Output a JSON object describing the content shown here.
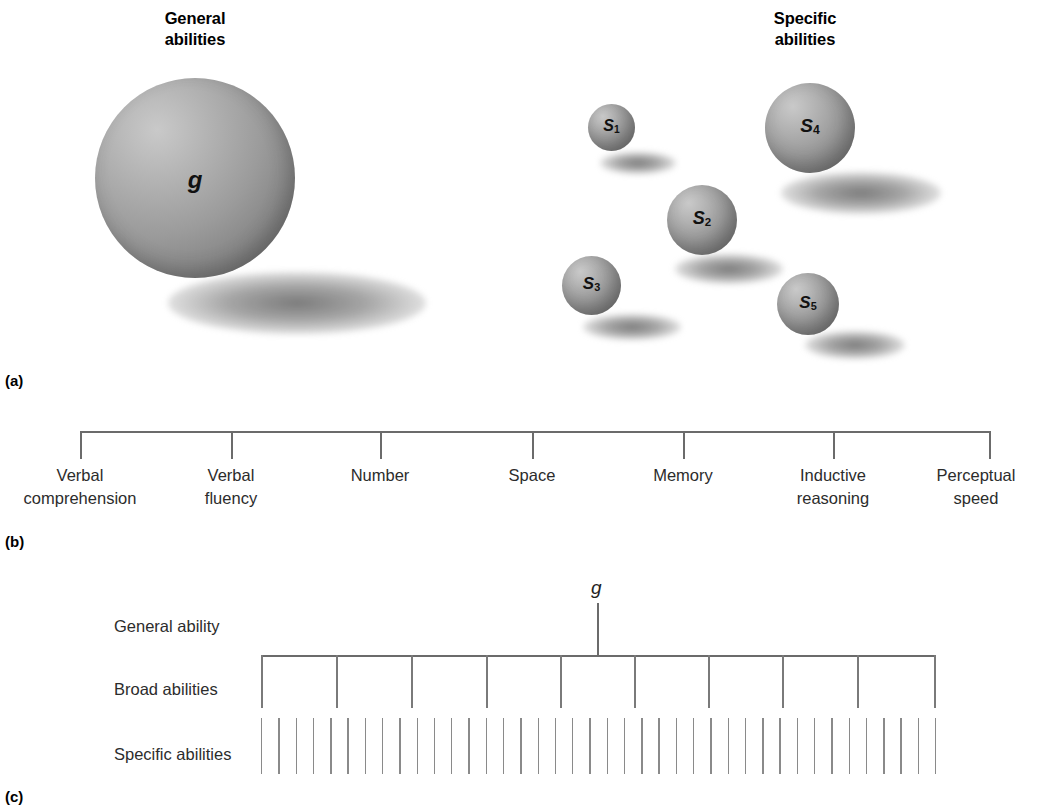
{
  "figure": {
    "panels": [
      {
        "letter": "(a)"
      },
      {
        "letter": "(b)"
      },
      {
        "letter": "(c)"
      }
    ]
  },
  "panel_a": {
    "headings": {
      "general": "General\nabilities",
      "specific": "Specific\nabilities"
    },
    "general_sphere": {
      "label": "g",
      "label_main": "g",
      "label_sub": ""
    },
    "specific_spheres": [
      {
        "label": "S1",
        "label_main": "S",
        "label_sub": "1"
      },
      {
        "label": "S2",
        "label_main": "S",
        "label_sub": "2"
      },
      {
        "label": "S3",
        "label_main": "S",
        "label_sub": "3"
      },
      {
        "label": "S4",
        "label_main": "S",
        "label_sub": "4"
      },
      {
        "label": "S5",
        "label_main": "S",
        "label_sub": "5"
      }
    ],
    "letter": "(a)"
  },
  "panel_b": {
    "letter": "(b)",
    "factors": [
      {
        "label": "Verbal\ncomprehension"
      },
      {
        "label": "Verbal\nfluency"
      },
      {
        "label": "Number"
      },
      {
        "label": "Space"
      },
      {
        "label": "Memory"
      },
      {
        "label": "Inductive\nreasoning"
      },
      {
        "label": "Perceptual\nspeed"
      }
    ]
  },
  "panel_c": {
    "letter": "(c)",
    "apex_label": "g",
    "rows": [
      {
        "label": "General ability"
      },
      {
        "label": "Broad abilities"
      },
      {
        "label": "Specific abilities"
      }
    ],
    "broad_ability_count": 10,
    "specific_ability_count": 40
  },
  "colors": {
    "sphere_light": "#c9c9c9",
    "sphere_dark": "#6a6a6a",
    "line": "#6b6b6b",
    "text": "#2c2c2c"
  }
}
